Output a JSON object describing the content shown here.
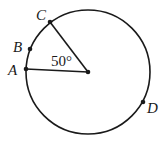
{
  "diagram": {
    "type": "circle-with-central-angle",
    "circle": {
      "cx": 88,
      "cy": 72,
      "r": 62
    },
    "center": {
      "x": 88,
      "y": 72
    },
    "points": [
      {
        "label": "A",
        "x": 26,
        "y": 69,
        "label_x": 8,
        "label_y": 75
      },
      {
        "label": "B",
        "x": 30,
        "y": 49,
        "label_x": 13,
        "label_y": 52
      },
      {
        "label": "C",
        "x": 50,
        "y": 22,
        "label_x": 36,
        "label_y": 20
      },
      {
        "label": "D",
        "x": 143,
        "y": 102,
        "label_x": 147,
        "label_y": 113
      }
    ],
    "radii": [
      "A",
      "C"
    ],
    "angle": {
      "label": "50°",
      "x": 51,
      "y": 66,
      "between": [
        "A",
        "C"
      ],
      "vertex": "center"
    },
    "stroke_color": "#1a1a1a"
  }
}
